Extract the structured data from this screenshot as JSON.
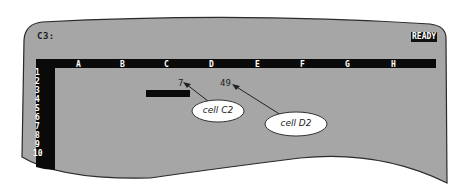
{
  "status_bar": {
    "cell_reference": "C3:",
    "mode_indicator": "READY"
  },
  "grid": {
    "columns": [
      "A",
      "B",
      "C",
      "D",
      "E",
      "F",
      "G",
      "H"
    ],
    "rows": [
      "1",
      "2",
      "3",
      "4",
      "5",
      "6",
      "7",
      "8",
      "9",
      "10"
    ],
    "cells": {
      "C2": "7",
      "D2": "49"
    },
    "selected_cell": "C3"
  },
  "callouts": [
    {
      "label": "cell C2",
      "target": "C2"
    },
    {
      "label": "cell D2",
      "target": "D2"
    }
  ],
  "colors": {
    "screen": "#a6a6a6",
    "border": "#111111",
    "header_bar": "#0a0a0a",
    "callout_fill": "#ffffff"
  }
}
